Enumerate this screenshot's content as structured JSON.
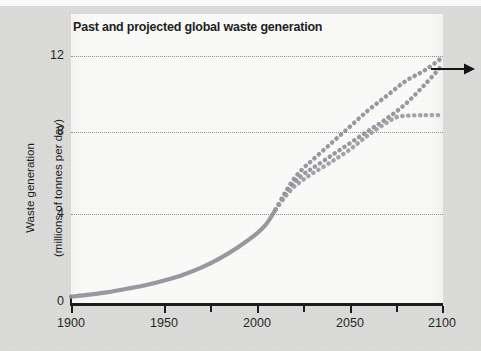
{
  "chart_data": {
    "type": "line",
    "title": "Past and projected global waste generation",
    "xlabel": "",
    "ylabel": "Waste generation\n(millions of tonnes per day)",
    "xlim": [
      1900,
      2100
    ],
    "ylim": [
      0,
      12.6
    ],
    "xticks": [
      1900,
      1950,
      2000,
      2050,
      2100
    ],
    "xticks_minor": [
      1925,
      1975,
      2025,
      2075
    ],
    "yticks": [
      0,
      4,
      8,
      12
    ],
    "grid": "horizontal-dotted",
    "legend": "none",
    "annotations": [
      {
        "name": "continuation-arrow",
        "text": "",
        "x": 2100,
        "y": 11.7,
        "direction": "right"
      }
    ],
    "series": [
      {
        "name": "Historical waste generation",
        "style": "solid",
        "color": "#8e9099",
        "x": [
          1900,
          1910,
          1920,
          1930,
          1940,
          1950,
          1960,
          1970,
          1980,
          1990,
          2000,
          2005,
          2010
        ],
        "values": [
          0.4,
          0.5,
          0.62,
          0.78,
          0.95,
          1.18,
          1.45,
          1.8,
          2.25,
          2.8,
          3.45,
          3.9,
          4.6
        ]
      },
      {
        "name": "Projection high",
        "style": "dotted",
        "color": "#8e9099",
        "x": [
          2010,
          2015,
          2020,
          2025,
          2030,
          2040,
          2050,
          2060,
          2070,
          2080,
          2090,
          2100
        ],
        "values": [
          4.6,
          5.4,
          6.1,
          6.6,
          7.0,
          7.8,
          8.6,
          9.4,
          10.1,
          10.8,
          11.3,
          11.95
        ]
      },
      {
        "name": "Projection middle",
        "style": "dotted",
        "color": "#8e9099",
        "x": [
          2010,
          2015,
          2020,
          2025,
          2030,
          2040,
          2050,
          2060,
          2070,
          2080,
          2090,
          2100
        ],
        "values": [
          4.6,
          5.3,
          5.9,
          6.3,
          6.6,
          7.2,
          7.8,
          8.4,
          9.0,
          9.7,
          10.6,
          11.6
        ]
      },
      {
        "name": "Projection low (plateau)",
        "style": "dotted",
        "color": "#9a9ca3",
        "x": [
          2010,
          2015,
          2020,
          2025,
          2030,
          2040,
          2050,
          2060,
          2070,
          2075,
          2080,
          2090,
          2100
        ],
        "values": [
          4.6,
          5.2,
          5.7,
          6.05,
          6.35,
          6.9,
          7.5,
          8.2,
          8.8,
          9.05,
          9.12,
          9.15,
          9.15
        ]
      }
    ]
  },
  "figure": {
    "title": "Past and projected global waste generation",
    "y_axis_label_line1": "Waste generation",
    "y_axis_label_line2": "(millions of tonnes per day)",
    "y_tick_0": "0",
    "y_tick_1": "4",
    "y_tick_2": "8",
    "y_tick_3": "12",
    "x_tick_0": "1900",
    "x_tick_1": "1950",
    "x_tick_2": "2000",
    "x_tick_3": "2050",
    "x_tick_4": "2100"
  },
  "colors": {
    "curve": "#8e9099",
    "axis": "#1a1a1a",
    "grid": "#8d8d8b",
    "panel": "#fbfbfa",
    "page": "#dcdcda"
  }
}
